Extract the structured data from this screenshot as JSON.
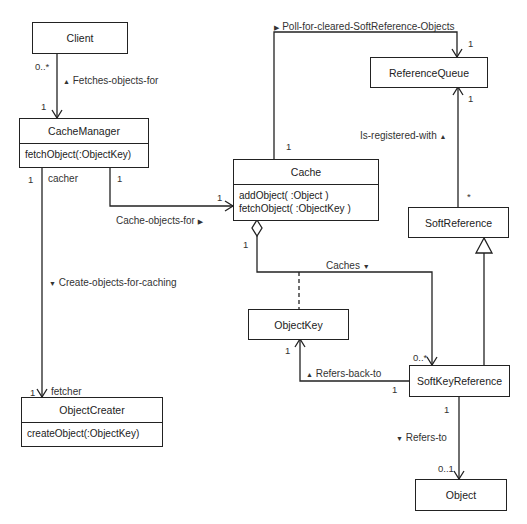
{
  "classes": {
    "client": {
      "name": "Client"
    },
    "cache_manager": {
      "name": "CacheManager",
      "ops": [
        "fetchObject(:ObjectKey)"
      ]
    },
    "cache": {
      "name": "Cache",
      "ops": [
        "addObject( :Object )",
        "fetchObject( :ObjectKey )"
      ]
    },
    "reference_queue": {
      "name": "ReferenceQueue"
    },
    "soft_reference": {
      "name": "SoftReference"
    },
    "object_key": {
      "name": "ObjectKey"
    },
    "soft_key_reference": {
      "name": "SoftKeyReference"
    },
    "object_creater": {
      "name": "ObjectCreater",
      "ops": [
        "createObject(:ObjectKey)"
      ]
    },
    "object": {
      "name": "Object"
    }
  },
  "associations": {
    "fetches": {
      "label": "Fetches-objects-for",
      "dir_icon": "▲",
      "from_mult": "0..*",
      "to_mult": "1"
    },
    "poll": {
      "label": "Poll-for-cleared-SoftReference-Objects",
      "dir_icon": "▶",
      "from_mult": "1",
      "to_mult": "1"
    },
    "registered": {
      "label": "Is-registered-with",
      "dir_icon": "▲",
      "from_mult": "*",
      "to_mult": "1"
    },
    "cache_objects": {
      "label": "Cache-objects-for",
      "dir_icon": "▶",
      "from_mult": "1",
      "to_mult": "1"
    },
    "create_objects": {
      "label": "Create-objects-for-caching",
      "dir_icon": "▼",
      "from_mult": "1",
      "from_role": "cacher",
      "to_mult": "1",
      "to_role": "fetcher"
    },
    "caches": {
      "label": "Caches",
      "dir_icon": "▼",
      "from_mult": "1",
      "to_mult": "0..*"
    },
    "refers_back": {
      "label": "Refers-back-to",
      "dir_icon": "▲",
      "from_mult": "1",
      "to_mult": "1"
    },
    "refers_to": {
      "label": "Refers-to",
      "dir_icon": "▼",
      "from_mult": "1",
      "to_mult": "0..1"
    }
  },
  "colors": {
    "line": "#222222",
    "background": "#ffffff"
  }
}
